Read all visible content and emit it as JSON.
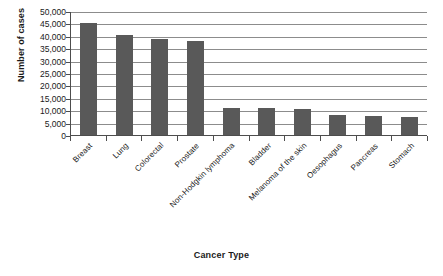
{
  "chart_data": {
    "type": "bar",
    "title": "",
    "xlabel": "Cancer Type",
    "ylabel": "Number of cases",
    "categories": [
      "Breast",
      "Lung",
      "Colorectal",
      "Prostate",
      "Non-Hodgkin lymphoma",
      "Bladder",
      "Melanoma of the skin",
      "Oesophagus",
      "Pancreas",
      "Stomach"
    ],
    "values": [
      45000,
      40400,
      38800,
      38000,
      10800,
      10900,
      10400,
      8200,
      7500,
      7400
    ],
    "ylim": [
      0,
      50000
    ],
    "ytick_labels": [
      "0",
      "5,000",
      "10,000",
      "15,000",
      "20,000",
      "25,000",
      "30,000",
      "35,000",
      "40,000",
      "45,000",
      "50,000"
    ],
    "ytick_values": [
      0,
      5000,
      10000,
      15000,
      20000,
      25000,
      30000,
      35000,
      40000,
      45000,
      50000
    ],
    "grid": true,
    "legend": false,
    "bar_color": "#595959",
    "grid_color": "#8c8c8c",
    "axis_color": "#4d4d4d"
  }
}
